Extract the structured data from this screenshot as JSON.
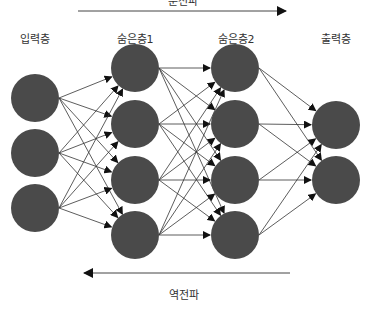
{
  "diagram": {
    "forward_label": "순전파",
    "backward_label": "역전파",
    "node_color": "#4a4a4a",
    "edge_color": "#333333",
    "layers": [
      {
        "label": "입력층",
        "x": 35,
        "nodes": [
          98,
          153,
          208
        ]
      },
      {
        "label": "숨은층1",
        "x": 135,
        "nodes": [
          68,
          124,
          180,
          235
        ]
      },
      {
        "label": "숨은층2",
        "x": 235,
        "nodes": [
          68,
          124,
          180,
          235
        ]
      },
      {
        "label": "출력층",
        "x": 336,
        "nodes": [
          125,
          180
        ]
      }
    ]
  }
}
